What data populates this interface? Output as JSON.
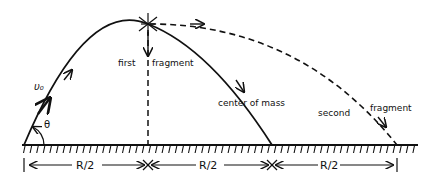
{
  "diagram": {
    "colors": {
      "ink": "#111111",
      "background": "#ffffff"
    },
    "labels": {
      "initial_velocity": "υ₀",
      "angle": "θ",
      "first_fragment_a": "first",
      "first_fragment_b": "fragment",
      "center_of_mass": "center of mass",
      "second_fragment_a": "second",
      "second_fragment_b": "fragment"
    },
    "dimensions": [
      {
        "label": "R/2"
      },
      {
        "label": "R/2"
      },
      {
        "label": "R/2"
      }
    ],
    "elements": {
      "ground": "hatched ground line",
      "trajectory": "solid parabolic path of center of mass",
      "second_fragment_path": "dashed path of second fragment",
      "first_fragment_path": "dashed vertical drop of first fragment",
      "explosion": "starburst at apex"
    }
  }
}
